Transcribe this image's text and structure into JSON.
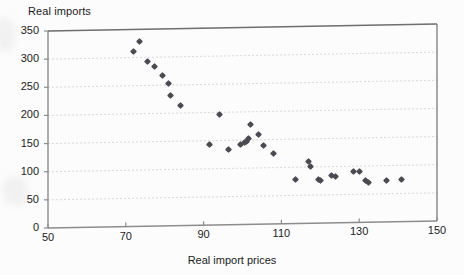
{
  "chart_data": {
    "type": "scatter",
    "title": "",
    "xlabel": "Real import prices",
    "ylabel": "Real imports",
    "xlim": [
      50,
      150
    ],
    "ylim": [
      0,
      350
    ],
    "xticks": [
      50,
      70,
      90,
      110,
      130,
      150
    ],
    "yticks": [
      0,
      50,
      100,
      150,
      200,
      250,
      300,
      350
    ],
    "grid": "horizontal-dashed",
    "legend": "none",
    "marker": "diamond",
    "marker_color": "#4a4a52",
    "points": [
      {
        "x": 72.0,
        "y": 310
      },
      {
        "x": 73.5,
        "y": 328
      },
      {
        "x": 75.5,
        "y": 292
      },
      {
        "x": 77.5,
        "y": 283
      },
      {
        "x": 79.5,
        "y": 267
      },
      {
        "x": 81.0,
        "y": 253
      },
      {
        "x": 81.5,
        "y": 232
      },
      {
        "x": 84.0,
        "y": 214
      },
      {
        "x": 91.5,
        "y": 143
      },
      {
        "x": 94.0,
        "y": 196
      },
      {
        "x": 96.5,
        "y": 134
      },
      {
        "x": 99.5,
        "y": 142
      },
      {
        "x": 100.5,
        "y": 145
      },
      {
        "x": 101.0,
        "y": 148
      },
      {
        "x": 101.5,
        "y": 152
      },
      {
        "x": 102.0,
        "y": 178
      },
      {
        "x": 104.0,
        "y": 160
      },
      {
        "x": 105.5,
        "y": 139
      },
      {
        "x": 108.0,
        "y": 125
      },
      {
        "x": 113.5,
        "y": 79
      },
      {
        "x": 117.0,
        "y": 109
      },
      {
        "x": 117.5,
        "y": 101
      },
      {
        "x": 119.5,
        "y": 78
      },
      {
        "x": 120.0,
        "y": 75
      },
      {
        "x": 123.0,
        "y": 84
      },
      {
        "x": 124.0,
        "y": 83
      },
      {
        "x": 128.5,
        "y": 91
      },
      {
        "x": 130.0,
        "y": 91
      },
      {
        "x": 131.5,
        "y": 74
      },
      {
        "x": 132.5,
        "y": 71
      },
      {
        "x": 137.0,
        "y": 73
      },
      {
        "x": 141.0,
        "y": 75
      }
    ],
    "axis_line_color": "#8c8c8c",
    "grid_color": "#cfcfcf"
  },
  "axes": {
    "y_title": "Real imports",
    "x_title": "Real import prices",
    "y_ticks": [
      "350",
      "300",
      "250",
      "200",
      "150",
      "100",
      "50",
      "0"
    ],
    "x_ticks": [
      "50",
      "70",
      "90",
      "110",
      "130",
      "150"
    ]
  }
}
